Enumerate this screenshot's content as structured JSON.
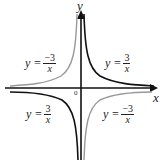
{
  "axes": {
    "x_label": "x",
    "y_label": "y",
    "origin_label": "0"
  },
  "labels": [
    {
      "quadrant": "top-left",
      "lhs": "y =",
      "num": "−3",
      "den": "x"
    },
    {
      "quadrant": "top-right",
      "lhs": "y =",
      "num": "3",
      "den": "x"
    },
    {
      "quadrant": "bottom-left",
      "lhs": "y =",
      "num": "3",
      "den": "x"
    },
    {
      "quadrant": "bottom-right",
      "lhs": "y =",
      "num": "−3",
      "den": "x"
    }
  ],
  "colors": {
    "y_equals_3_over_x": "#111111",
    "y_equals_neg3_over_x": "#999999",
    "axes": "#111111"
  }
}
